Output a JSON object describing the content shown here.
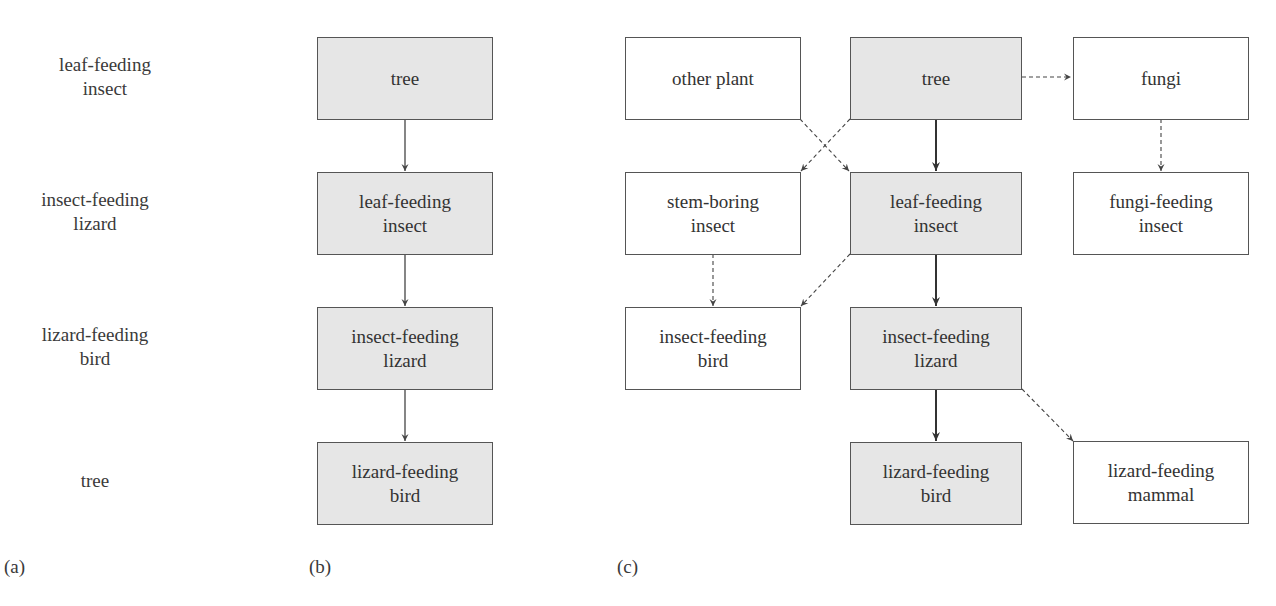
{
  "panel_a": {
    "caption": "(a)",
    "labels": [
      "leaf-feeding\ninsect",
      "insect-feeding\nlizard",
      "lizard-feeding\nbird",
      "tree"
    ]
  },
  "panel_b": {
    "caption": "(b)",
    "nodes": [
      "tree",
      "leaf-feeding\ninsect",
      "insect-feeding\nlizard",
      "lizard-feeding\nbird"
    ]
  },
  "panel_c": {
    "caption": "(c)",
    "nodes": {
      "other_plant": "other plant",
      "tree": "tree",
      "fungi": "fungi",
      "stem_boring_insect": "stem-boring\ninsect",
      "leaf_feeding_insect": "leaf-feeding\ninsect",
      "fungi_feeding_insect": "fungi-feeding\ninsect",
      "insect_feeding_bird": "insect-feeding\nbird",
      "insect_feeding_lizard": "insect-feeding\nlizard",
      "lizard_feeding_bird": "lizard-feeding\nbird",
      "lizard_feeding_mammal": "lizard-feeding\nmammal"
    },
    "edges": [
      {
        "from": "tree",
        "to": "leaf_feeding_insect",
        "style": "solid"
      },
      {
        "from": "leaf_feeding_insect",
        "to": "insect_feeding_lizard",
        "style": "solid"
      },
      {
        "from": "insect_feeding_lizard",
        "to": "lizard_feeding_bird",
        "style": "solid"
      },
      {
        "from": "tree",
        "to": "fungi",
        "style": "dashed"
      },
      {
        "from": "tree",
        "to": "stem_boring_insect",
        "style": "dashed"
      },
      {
        "from": "other_plant",
        "to": "leaf_feeding_insect",
        "style": "dashed"
      },
      {
        "from": "fungi",
        "to": "fungi_feeding_insect",
        "style": "dashed"
      },
      {
        "from": "stem_boring_insect",
        "to": "insect_feeding_bird",
        "style": "dashed"
      },
      {
        "from": "leaf_feeding_insect",
        "to": "insect_feeding_bird",
        "style": "dashed"
      },
      {
        "from": "insect_feeding_lizard",
        "to": "lizard_feeding_mammal",
        "style": "dashed"
      }
    ]
  },
  "colors": {
    "shaded_fill": "#e6e6e6",
    "border": "#555555",
    "text": "#333333"
  }
}
